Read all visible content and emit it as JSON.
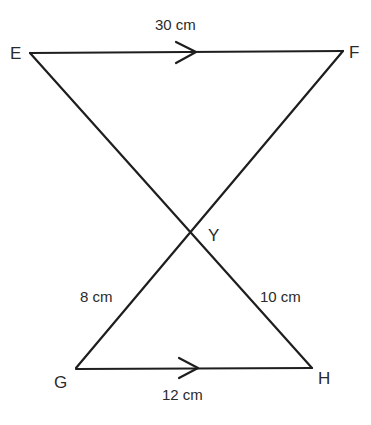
{
  "figure": {
    "points": {
      "E": "E",
      "F": "F",
      "G": "G",
      "H": "H",
      "Y": "Y"
    },
    "measurements": {
      "EF": "30 cm",
      "GH": "12 cm",
      "GY": "8 cm",
      "YH": "10 cm"
    },
    "parallel_marks": [
      "EF",
      "GH"
    ]
  }
}
